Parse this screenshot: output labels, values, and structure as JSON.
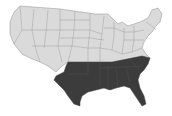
{
  "map": {
    "type": "choropleth",
    "region": "United States",
    "colors": {
      "default": "#dadada",
      "highlighted": "#3c3c3c",
      "border": "#8f8f8f",
      "background": "#ffffff"
    },
    "highlighted_states": [
      "Texas",
      "Oklahoma",
      "Arkansas",
      "Louisiana",
      "Mississippi",
      "Alabama",
      "Georgia",
      "Florida",
      "South Carolina",
      "North Carolina",
      "Tennessee"
    ]
  }
}
